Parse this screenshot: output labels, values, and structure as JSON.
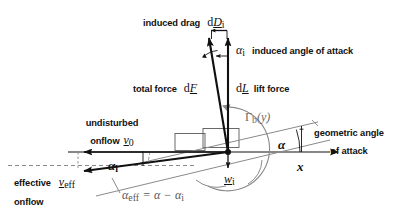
{
  "diagram": {
    "type": "aerodynamics-vector-diagram",
    "background_color": "#ffffff",
    "line_color": "#111111",
    "grey_line_color": "#8a8a8a",
    "dashed_line_color": "#8a8a8a"
  },
  "labels": {
    "induced_drag": {
      "text": "induced drag",
      "symbol_d": "d",
      "symbol_vec": "D",
      "symbol_sub": "i"
    },
    "induced_alpha": {
      "symbol": "α",
      "symbol_sub": "i",
      "text": "induced angle of attack"
    },
    "total_force": {
      "text": "total force",
      "symbol_d": "d",
      "symbol_vec": "F"
    },
    "lift_force": {
      "text": "lift force",
      "symbol_d": "d",
      "symbol_vec": "L"
    },
    "circulation": {
      "gamma": "Γ",
      "sub": "b",
      "arg": "(y)"
    },
    "undisturbed_onflow": {
      "line1": "undisturbed",
      "line2": "onflow",
      "symbol_vec": "v",
      "symbol_sub": "0"
    },
    "geometric_angle": {
      "line1": "geometric angle",
      "line2": "of attack"
    },
    "alpha_geometric": {
      "symbol": "α"
    },
    "alpha_induced_lower": {
      "symbol": "α",
      "symbol_sub": "i"
    },
    "x_axis": {
      "symbol": "x"
    },
    "downwash": {
      "symbol_vec": "w",
      "symbol_sub": "i"
    },
    "effective_onflow": {
      "line1": "effective",
      "line2": "onflow",
      "symbol_vec": "v",
      "symbol_sub": "eff"
    },
    "alpha_eff_equation": {
      "lhs_symbol": "α",
      "lhs_sub": "eff",
      "equals": "=",
      "rhs_symbol_1": "α",
      "minus": "−",
      "rhs_symbol_2": "α",
      "rhs_sub_2": "i"
    }
  }
}
